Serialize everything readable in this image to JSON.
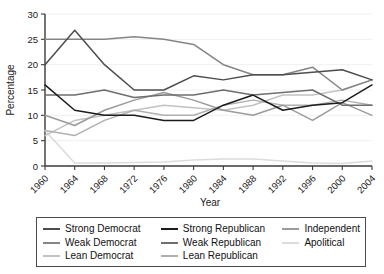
{
  "chart_data": {
    "type": "line",
    "title": "",
    "xlabel": "Year",
    "ylabel": "Percentage",
    "xlim": [
      1960,
      2004
    ],
    "ylim": [
      0,
      30
    ],
    "xticks": [
      "1960",
      "1964",
      "1968",
      "1972",
      "1976",
      "1980",
      "1984",
      "1988",
      "1992",
      "1996",
      "2000",
      "2004"
    ],
    "yticks": [
      "0",
      "5",
      "10",
      "15",
      "20",
      "25",
      "30"
    ],
    "grid": true,
    "legend_position": "below-plot",
    "x": [
      1960,
      1964,
      1968,
      1972,
      1976,
      1980,
      1984,
      1988,
      1992,
      1996,
      2000,
      2004
    ],
    "series": [
      {
        "name": "Strong Democrat",
        "color": "#4d4d4d",
        "values": [
          20.0,
          26.8,
          20.0,
          15.0,
          15.0,
          17.8,
          17.0,
          18.0,
          18.0,
          18.5,
          19.0,
          17.0
        ]
      },
      {
        "name": "Weak Democrat",
        "color": "#858585",
        "values": [
          25.0,
          25.0,
          25.0,
          25.5,
          25.0,
          24.0,
          20.0,
          18.0,
          18.0,
          19.5,
          15.0,
          17.0
        ]
      },
      {
        "name": "Lean Democrat",
        "color": "#c2c2c2",
        "values": [
          6.0,
          9.0,
          10.0,
          11.0,
          12.0,
          11.5,
          11.0,
          12.0,
          14.0,
          14.0,
          15.0,
          17.0
        ]
      },
      {
        "name": "Strong Republican",
        "color": "#1c1c1c",
        "values": [
          16.0,
          11.0,
          10.0,
          10.0,
          9.0,
          9.0,
          12.0,
          14.0,
          11.0,
          12.0,
          12.5,
          16.0
        ]
      },
      {
        "name": "Weak Republican",
        "color": "#6e6e6e",
        "values": [
          14.0,
          14.0,
          15.0,
          13.5,
          14.0,
          14.0,
          15.0,
          14.0,
          14.5,
          15.0,
          12.0,
          12.0
        ]
      },
      {
        "name": "Lean Republican",
        "color": "#b0b0b0",
        "values": [
          7.0,
          6.0,
          9.0,
          11.0,
          10.0,
          10.0,
          12.0,
          13.0,
          12.0,
          12.0,
          13.0,
          12.0
        ]
      },
      {
        "name": "Independent",
        "color": "#9b9b9b",
        "values": [
          10.0,
          8.0,
          11.0,
          13.0,
          14.5,
          13.0,
          11.0,
          10.0,
          12.0,
          9.0,
          12.5,
          10.0
        ]
      },
      {
        "name": "Apolitical",
        "color": "#dcdcdc",
        "values": [
          7.0,
          0.6,
          0.6,
          0.7,
          0.8,
          1.2,
          1.4,
          1.4,
          1.0,
          0.6,
          0.5,
          1.0
        ]
      }
    ],
    "legend_columns": [
      [
        "Strong Democrat",
        "Weak Democrat",
        "Lean Democrat"
      ],
      [
        "Strong Republican",
        "Weak Republican",
        "Lean Republican"
      ],
      [
        "Independent",
        "Apolitical"
      ]
    ]
  },
  "legend": {
    "items": [
      {
        "label": "Strong Democrat",
        "color": "#4d4d4d"
      },
      {
        "label": "Weak Democrat",
        "color": "#858585"
      },
      {
        "label": "Lean Democrat",
        "color": "#c2c2c2"
      },
      {
        "label": "Strong Republican",
        "color": "#1c1c1c"
      },
      {
        "label": "Weak Republican",
        "color": "#6e6e6e"
      },
      {
        "label": "Lean Republican",
        "color": "#b0b0b0"
      },
      {
        "label": "Independent",
        "color": "#9b9b9b"
      },
      {
        "label": "Apolitical",
        "color": "#dcdcdc"
      }
    ]
  },
  "axes": {
    "y_title": "Percentage",
    "x_title": "Year"
  }
}
